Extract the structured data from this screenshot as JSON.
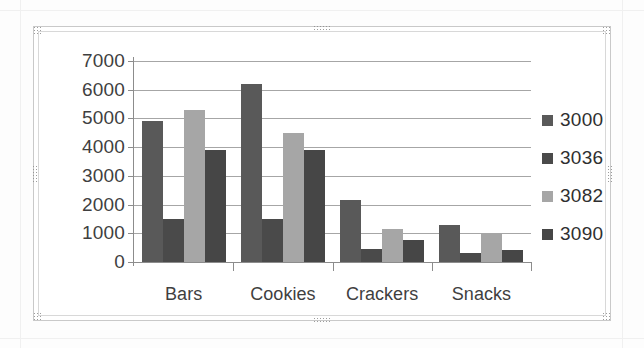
{
  "chart_object": {
    "selected": true,
    "handles": [
      "top-left",
      "top-center",
      "top-right",
      "left-center",
      "right-center",
      "bottom-left",
      "bottom-center",
      "bottom-right"
    ]
  },
  "chart_data": {
    "type": "bar",
    "title": "",
    "subtitle": "",
    "xlabel": "",
    "ylabel": "",
    "categories": [
      "Bars",
      "Cookies",
      "Crackers",
      "Snacks"
    ],
    "series": [
      {
        "name": "3000",
        "color": "#595959",
        "values": [
          4900,
          6200,
          2150,
          1300
        ]
      },
      {
        "name": "3036",
        "color": "#4a4a4a",
        "values": [
          1500,
          1500,
          450,
          300
        ]
      },
      {
        "name": "3082",
        "color": "#a6a6a6",
        "values": [
          5300,
          4500,
          1150,
          1000
        ]
      },
      {
        "name": "3090",
        "color": "#464646",
        "values": [
          3900,
          3900,
          750,
          420
        ]
      }
    ],
    "ylim": [
      0,
      7000
    ],
    "ytick_values": [
      0,
      1000,
      2000,
      3000,
      4000,
      5000,
      6000,
      7000
    ],
    "ytick_labels": [
      "0",
      "1000",
      "2000",
      "3000",
      "4000",
      "5000",
      "6000",
      "7000"
    ],
    "grid": true,
    "legend_position": "right",
    "legend_entries": [
      "3000",
      "3036",
      "3082",
      "3090"
    ],
    "bar_group_gap": true
  },
  "colors": {
    "gridline": "#a6a6a6",
    "axis": "#8c8c8c",
    "tick_text": "#3f3f3f",
    "plot_background": "#ffffff",
    "frame_border": "#c9c9c9",
    "handle": "#8c8c8c"
  }
}
